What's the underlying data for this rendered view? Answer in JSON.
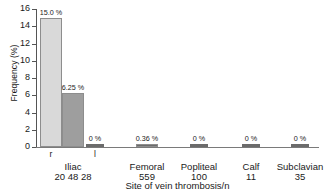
{
  "chart_data": {
    "type": "bar",
    "title": "",
    "xlabel": "Site of vein thrombosis/n",
    "ylabel": "Frequency (%)",
    "ylim": [
      0,
      16
    ],
    "yticks": [
      0,
      2,
      4,
      6,
      8,
      10,
      12,
      14,
      16
    ],
    "ytick_labels": [
      "0",
      "2",
      "4",
      "6",
      "8",
      "10",
      "12",
      "14",
      "16"
    ],
    "grid": false,
    "legend": "none",
    "categories": [
      "Iliac",
      "Femoral",
      "Popliteal",
      "Calf",
      "Subclavian"
    ],
    "category_counts": [
      "",
      "559",
      "100",
      "11",
      "35"
    ],
    "bars": [
      {
        "group": "Iliac",
        "sublabel": "r",
        "count": "20",
        "value": 15.0,
        "value_label": "15.0 %",
        "color": "#d9d9d9"
      },
      {
        "group": "Iliac",
        "sublabel": "",
        "count": "48",
        "value": 6.25,
        "value_label": "6.25 %",
        "color": "#9e9e9e"
      },
      {
        "group": "Iliac",
        "sublabel": "l",
        "count": "28",
        "value": 0,
        "value_label": "0 %",
        "color": "#6b6b6b"
      },
      {
        "group": "Femoral",
        "sublabel": "",
        "count": "559",
        "value": 0.36,
        "value_label": "0.36 %",
        "color": "#6b6b6b"
      },
      {
        "group": "Popliteal",
        "sublabel": "",
        "count": "100",
        "value": 0,
        "value_label": "0 %",
        "color": "#6b6b6b"
      },
      {
        "group": "Calf",
        "sublabel": "",
        "count": "11",
        "value": 0,
        "value_label": "0 %",
        "color": "#6b6b6b"
      },
      {
        "group": "Subclavian",
        "sublabel": "",
        "count": "35",
        "value": 0,
        "value_label": "0 %",
        "color": "#6b6b6b"
      }
    ],
    "iliac_counts_row": "20  48  28"
  }
}
